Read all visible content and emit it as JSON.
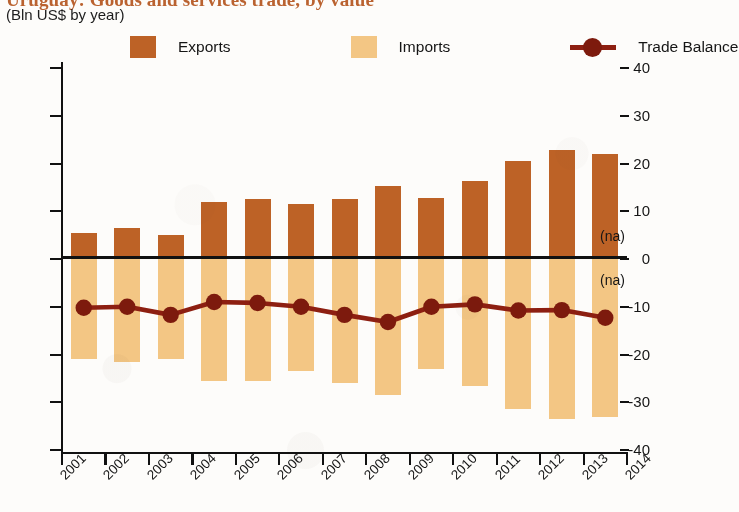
{
  "header": {
    "title": "Uruguay: Goods and services trade, by value",
    "subtitle": "(Bln US$ by year)"
  },
  "legend": {
    "items": [
      {
        "label": "Exports",
        "type": "swatch",
        "color": "#bd6226"
      },
      {
        "label": "Imports",
        "type": "swatch",
        "color": "#f3c684"
      },
      {
        "label": "Trade Balance",
        "type": "line",
        "color": "#8d1f11"
      }
    ]
  },
  "annotations": {
    "na_above": "(na)",
    "na_below": "(na)"
  },
  "chart_data": {
    "type": "bar",
    "title": "Uruguay: Goods and services trade, by value",
    "subtitle": "(Bln US$ by year)",
    "xlabel": "",
    "ylabel": "Bln US$ by year",
    "ylim": [
      -40,
      40
    ],
    "yticks": [
      40,
      30,
      20,
      10,
      0,
      -10,
      -20,
      -30,
      -40
    ],
    "ytick_labels": [
      "40",
      "30",
      "20",
      "10",
      "0",
      "-10",
      "-20",
      "-30",
      "-40"
    ],
    "xticks": [
      "2001",
      "2002",
      "2003",
      "2004",
      "2005",
      "2006",
      "2007",
      "2008",
      "2009",
      "2010",
      "2011",
      "2012",
      "2013",
      "2014"
    ],
    "categories": [
      "2001",
      "2002",
      "2003",
      "2004",
      "2005",
      "2006",
      "2007",
      "2008",
      "2009",
      "2010",
      "2011",
      "2012",
      "2013"
    ],
    "grid": false,
    "legend_position": "top",
    "series": [
      {
        "name": "Exports",
        "type": "bar",
        "color": "#bd6226",
        "values": [
          5.5,
          6.5,
          5.0,
          12.0,
          12.5,
          11.5,
          12.5,
          15.3,
          12.8,
          16.3,
          20.5,
          22.8,
          22.0
        ]
      },
      {
        "name": "Imports",
        "type": "bar",
        "color": "#f3c684",
        "values": [
          -21.0,
          -21.5,
          -21.0,
          -25.5,
          -25.5,
          -23.5,
          -26.0,
          -28.5,
          -23.0,
          -26.5,
          -31.5,
          -33.5,
          -33.0
        ]
      },
      {
        "name": "Trade Balance",
        "type": "line",
        "color": "#8d1f11",
        "values": [
          -10.2,
          -10.0,
          -11.7,
          -9.0,
          -9.2,
          -10.0,
          -11.7,
          -13.2,
          -10.0,
          -9.5,
          -10.8,
          -10.7,
          -12.3
        ]
      }
    ]
  }
}
